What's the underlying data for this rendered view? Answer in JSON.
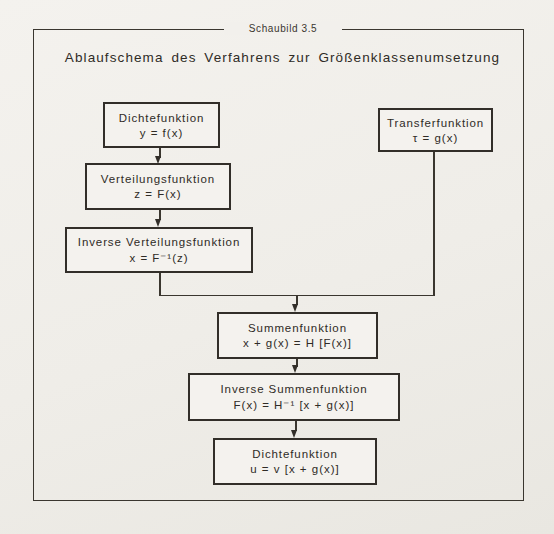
{
  "page": {
    "caption": "Schaubild 3.5",
    "title": "Ablaufschema des Verfahrens zur Größenklassenumsetzung"
  },
  "diagram": {
    "type": "flowchart",
    "nodes": [
      {
        "id": "dichtefunktion-1",
        "label": "Dichtefunktion",
        "formula": "y = f(x)"
      },
      {
        "id": "transferfunktion",
        "label": "Transferfunktion",
        "formula": "τ = g(x)"
      },
      {
        "id": "verteilungsfunktion",
        "label": "Verteilungsfunktion",
        "formula": "z = F(x)"
      },
      {
        "id": "inverse-verteilung",
        "label": "Inverse Verteilungsfunktion",
        "formula": "x = F⁻¹(z)"
      },
      {
        "id": "summenfunktion",
        "label": "Summenfunktion",
        "formula": "x + g(x) = H [F(x)]"
      },
      {
        "id": "inverse-summenfunktion",
        "label": "Inverse Summenfunktion",
        "formula": "F(x) = H⁻¹ [x + g(x)]"
      },
      {
        "id": "dichtefunktion-2",
        "label": "Dichtefunktion",
        "formula": "u = v [x + g(x)]"
      }
    ],
    "edges": [
      "dichtefunktion-1 → verteilungsfunktion",
      "verteilungsfunktion → inverse-verteilung",
      "inverse-verteilung → summenfunktion",
      "transferfunktion → summenfunktion",
      "summenfunktion → inverse-summenfunktion",
      "inverse-summenfunktion → dichtefunktion-2"
    ],
    "colors": {
      "ink": "#322e29",
      "paper": "#f2f0ec"
    }
  }
}
